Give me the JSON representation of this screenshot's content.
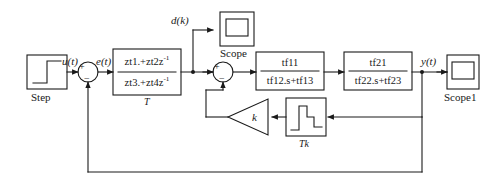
{
  "diagram": {
    "stroke_color": "#1a1a1a",
    "text_color": "#1a1a1a",
    "background": "#ffffff"
  },
  "blocks": {
    "step": {
      "name": "Step",
      "label": "Step",
      "icon": "step-waveform-icon"
    },
    "discrete_tf": {
      "numerator": "zt1.+zt2z",
      "numerator_exp": "-1",
      "denominator": "zt3.+zt4z",
      "denominator_exp": "-1",
      "sample_time_label": "T"
    },
    "tf1": {
      "numerator": "tf11",
      "denominator": "tf12.s+tf13"
    },
    "tf2": {
      "numerator": "tf21",
      "denominator": "tf22.s+tf23"
    },
    "gain": {
      "label": "k",
      "shape": "triangle"
    },
    "pulse": {
      "label": "Tk",
      "icon": "pulse-staircase-icon"
    },
    "scope_top": {
      "label": "Scope",
      "icon": "scope-screen-icon"
    },
    "scope_out": {
      "label": "Scope1",
      "icon": "scope-screen-icon"
    }
  },
  "summers": {
    "outer": {
      "plus": "+",
      "minus": "−"
    },
    "inner": {
      "plus": "+",
      "minus": "−"
    }
  },
  "signals": {
    "u": "u(t)",
    "e": "e(t)",
    "d": "d(k)",
    "y": "y(t)"
  }
}
